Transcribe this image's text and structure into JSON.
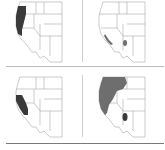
{
  "figure": {
    "type": "range-map-panels",
    "region": "Western United States",
    "layout": "2x2 grid",
    "colors": {
      "background": "#ffffff",
      "state_lines": "#a8a8a8",
      "range_dark": "#3a3a3a",
      "range_medium": "#6e6e6e",
      "divider": "#bdbdbd",
      "bottom_rule": "#7a7a7a"
    },
    "panels": [
      {
        "position": "top-left",
        "shaded_area": "coastal Pacific Northwest to northern California",
        "shade": "dark"
      },
      {
        "position": "top-right",
        "shaded_area": "small patch in southern Arizona and thin strip along southern California coast",
        "shade": "medium"
      },
      {
        "position": "bottom-left",
        "shaded_area": "central and southern California coast",
        "shade": "dark"
      },
      {
        "position": "bottom-right",
        "shaded_area": "broad area from Washington/Oregon through Idaho, Nevada, California, plus patch in Arizona",
        "shade": "medium"
      }
    ]
  }
}
